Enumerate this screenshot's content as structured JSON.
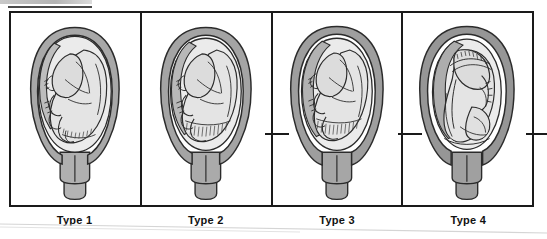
{
  "figure": {
    "panel_count": 4,
    "frame_color": "#1a1a1a",
    "background_color": "#ffffff"
  },
  "colors": {
    "myometrium_wall": "#a8a8a8",
    "myometrium_wall_dark": "#8f8f8f",
    "placenta": "#bdbdbd",
    "amniotic_sac": "#eaeaea",
    "fetus_fill": "#e2e2e2",
    "cervix": "#b0b0b0",
    "outline": "#2b2b2b",
    "frame": "#1a1a1a",
    "label_text": "#111111"
  },
  "panels": [
    {
      "id": "type-1",
      "label": "Type 1",
      "wall_thickness": "thin",
      "description": "Uterus in sagittal section with fetus in cephalic presentation; thin uterine wall"
    },
    {
      "id": "type-2",
      "label": "Type 2",
      "wall_thickness": "moderate",
      "description": "Uterus in sagittal section with fetus in cephalic presentation; moderately thick uterine wall"
    },
    {
      "id": "type-3",
      "label": "Type 3",
      "wall_thickness": "thick",
      "description": "Uterus in sagittal section with fetus in cephalic presentation; thick uterine wall"
    },
    {
      "id": "type-4",
      "label": "Type 4",
      "wall_thickness": "thickest",
      "description": "Uterus in sagittal section with fetus rotated, back toward viewer; thickest uterine wall"
    }
  ],
  "tick_marks": [
    {
      "id": "tick-between-2-and-3"
    },
    {
      "id": "tick-between-3-and-4"
    },
    {
      "id": "tick-right-edge"
    }
  ]
}
